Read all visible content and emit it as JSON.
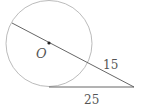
{
  "diagram": {
    "type": "circle-secant-tangent",
    "circle": {
      "center_label": "O",
      "cx": 49,
      "cy": 43.5,
      "r": 43
    },
    "secant": {
      "start": [
        12,
        23
      ],
      "end": [
        134,
        87
      ],
      "external_segment_label": "15"
    },
    "tangent": {
      "start": [
        49,
        87
      ],
      "end": [
        134,
        87
      ],
      "label": "25"
    },
    "colors": {
      "circle": "#aaaaaa",
      "lines": "#555555",
      "text": "#555555"
    }
  }
}
